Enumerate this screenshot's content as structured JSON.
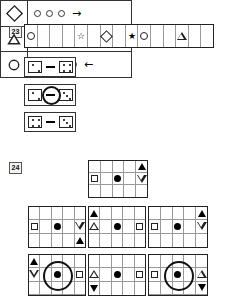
{
  "worksheet": {
    "questions": [
      {
        "number": "23",
        "strip": {
          "cells": [
            "circle-outline",
            "",
            "",
            "",
            "star-outline",
            "",
            "diamond-outline",
            "",
            "star-filled",
            "circle-outline",
            "",
            "",
            "triangle-outline",
            "",
            ""
          ]
        },
        "clues": [
          {
            "label": "clue-dice-1",
            "left_die": "pip-2",
            "connector": "dash",
            "right_die": "pip-4",
            "ring": false
          },
          {
            "label": "clue-dice-2",
            "left_die": "pip-2",
            "connector": "dash",
            "right_die": "pip-3",
            "ring": true
          },
          {
            "label": "clue-dice-3",
            "left_die": "pip-4",
            "connector": "dash",
            "right_die": "pip-3",
            "ring": false
          }
        ],
        "answers": [
          {
            "key": "diamond-outline",
            "count": 3,
            "direction": "right",
            "arrow": "→"
          },
          {
            "key": "triangle-outline",
            "count": 5,
            "direction": "right",
            "arrow": "→"
          },
          {
            "key": "circle-outline",
            "count": 4,
            "direction": "left",
            "arrow": "←"
          }
        ]
      },
      {
        "number": "24",
        "prompt_grid": {
          "rows": 3,
          "cols": 5,
          "cells": [
            [
              "",
              "",
              "",
              "",
              "triangle-up-filled"
            ],
            [
              "square-outline",
              "",
              "dot-filled",
              "",
              "triangle-down-outline"
            ],
            [
              "",
              "",
              "",
              "",
              ""
            ]
          ],
          "ring": null
        },
        "options": [
          {
            "id": "option-1",
            "rows": 3,
            "cols": 5,
            "cells": [
              [
                "",
                "",
                "",
                "",
                ""
              ],
              [
                "square-outline",
                "",
                "dot-filled",
                "",
                "triangle-down-outline"
              ],
              [
                "",
                "",
                "",
                "",
                "triangle-up-filled"
              ]
            ],
            "ring": null
          },
          {
            "id": "option-2",
            "rows": 3,
            "cols": 5,
            "cells": [
              [
                "triangle-up-filled",
                "",
                "",
                "",
                ""
              ],
              [
                "triangle-up-outline",
                "",
                "dot-filled",
                "",
                "square-outline"
              ],
              [
                "",
                "",
                "",
                "",
                ""
              ]
            ],
            "ring": null
          },
          {
            "id": "option-3",
            "rows": 3,
            "cols": 5,
            "cells": [
              [
                "",
                "",
                "",
                "",
                "triangle-up-filled"
              ],
              [
                "square-outline",
                "",
                "dot-filled",
                "",
                "triangle-down-outline"
              ],
              [
                "",
                "",
                "",
                "",
                ""
              ]
            ],
            "ring": null
          },
          {
            "id": "option-4",
            "rows": 3,
            "cols": 5,
            "cells": [
              [
                "triangle-up-filled",
                "",
                "",
                "",
                ""
              ],
              [
                "triangle-down-outline",
                "",
                "dot-filled",
                "",
                "square-outline"
              ],
              [
                "",
                "",
                "",
                "",
                ""
              ]
            ],
            "ring": "center"
          },
          {
            "id": "option-5",
            "rows": 3,
            "cols": 5,
            "cells": [
              [
                "",
                "",
                "",
                "",
                ""
              ],
              [
                "triangle-up-outline",
                "",
                "dot-filled",
                "",
                "square-outline"
              ],
              [
                "triangle-down-filled",
                "",
                "",
                "",
                ""
              ]
            ],
            "ring": null
          },
          {
            "id": "option-6",
            "rows": 3,
            "cols": 5,
            "cells": [
              [
                "",
                "",
                "",
                "",
                ""
              ],
              [
                "square-outline",
                "",
                "dot-filled",
                "",
                "triangle-up-outline"
              ],
              [
                "",
                "",
                "",
                "",
                "triangle-down-filled"
              ]
            ],
            "ring": "center"
          }
        ]
      }
    ]
  },
  "colors": {
    "ink": "#000000",
    "border": "#333333",
    "grid_line": "#999999",
    "label_bg": "#f2f2f2"
  }
}
